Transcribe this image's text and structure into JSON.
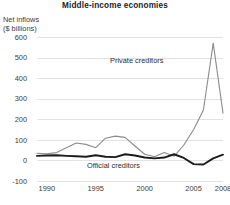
{
  "chart_data": {
    "type": "line",
    "title": "Middle-income economies",
    "ylabel_line1": "Net inflows",
    "ylabel_line2": "($ billions)",
    "xlabel": "",
    "grid": true,
    "legend_position": "inline-annotations",
    "xlim": [
      1989,
      2008
    ],
    "ylim": [
      -100,
      600
    ],
    "ytick_labels": [
      "600",
      "500",
      "400",
      "300",
      "200",
      "100",
      "0",
      "-100"
    ],
    "ytick_values": [
      600,
      500,
      400,
      300,
      200,
      100,
      0,
      -100
    ],
    "xtick_labels": [
      "1990",
      "1995",
      "2000",
      "2005",
      "2008"
    ],
    "xtick_values": [
      1990,
      1995,
      2000,
      2005,
      2008
    ],
    "x": [
      1989,
      1990,
      1991,
      1992,
      1993,
      1994,
      1995,
      1996,
      1997,
      1998,
      1999,
      2000,
      2001,
      2002,
      2003,
      2004,
      2005,
      2006,
      2007,
      2008
    ],
    "series": [
      {
        "name": "Private creditors",
        "color": "#8c8c8c",
        "values": [
          35,
          32,
          38,
          62,
          85,
          78,
          62,
          108,
          118,
          112,
          70,
          30,
          18,
          38,
          20,
          75,
          150,
          245,
          570,
          230
        ]
      },
      {
        "name": "Official creditors",
        "color": "#1c1c1c",
        "values": [
          22,
          24,
          25,
          22,
          20,
          18,
          25,
          18,
          16,
          30,
          24,
          14,
          10,
          14,
          30,
          12,
          -18,
          -20,
          10,
          28
        ]
      }
    ],
    "annotations": [
      {
        "text": "Private creditors",
        "series": "Private creditors"
      },
      {
        "text": "Official creditors",
        "series": "Official creditors"
      }
    ]
  },
  "footnote": {
    "text": ""
  }
}
